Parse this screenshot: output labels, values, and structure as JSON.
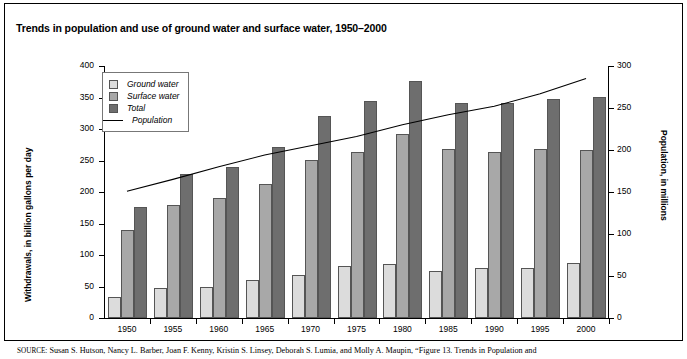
{
  "figure": {
    "title": "Trends in population and use of ground water and surface water, 1950–2000",
    "source_prefix": "SOURCE:",
    "source_text": "Susan S. Hutson, Nancy L. Barber, Joan F. Kenny, Kristin S. Linsey, Deborah S. Lumia, and Molly A. Maupin, “Figure 13. Trends in Population and"
  },
  "legend": {
    "position": "top-left-inside",
    "items": [
      {
        "label": "Ground water",
        "marker": "swatch",
        "color": "#dcdcdc",
        "icon": "legend-swatch-ground-water"
      },
      {
        "label": "Surface water",
        "marker": "swatch",
        "color": "#a8a8a8",
        "icon": "legend-swatch-surface-water"
      },
      {
        "label": "Total",
        "marker": "swatch",
        "color": "#6e6e6e",
        "icon": "legend-swatch-total"
      },
      {
        "label": "Population",
        "marker": "line",
        "color": "#000000",
        "icon": "legend-line-population"
      }
    ]
  },
  "chart_data": {
    "type": "bar",
    "title": "Trends in population and use of ground water and surface water, 1950–2000",
    "xlabel": "",
    "ylabel": "Withdrawals, in billion gallons per day",
    "y2label": "Population, in millions",
    "ylim": [
      0,
      400
    ],
    "y2lim": [
      0,
      300
    ],
    "yticks": [
      0,
      50,
      100,
      150,
      200,
      250,
      300,
      350,
      400
    ],
    "y2ticks": [
      0,
      50,
      100,
      150,
      200,
      250,
      300
    ],
    "grid": false,
    "categories": [
      "1950",
      "1955",
      "1960",
      "1965",
      "1970",
      "1975",
      "1980",
      "1985",
      "1990",
      "1995",
      "2000"
    ],
    "series": [
      {
        "name": "Ground water",
        "type": "bar",
        "axis": "left",
        "color": "#dcdcdc",
        "values": [
          34,
          47,
          50,
          60,
          68,
          83,
          86,
          74,
          80,
          79,
          87
        ]
      },
      {
        "name": "Surface water",
        "type": "bar",
        "axis": "left",
        "color": "#a8a8a8",
        "values": [
          140,
          180,
          190,
          213,
          251,
          263,
          292,
          269,
          263,
          268,
          267
        ]
      },
      {
        "name": "Total",
        "type": "bar",
        "axis": "left",
        "color": "#6e6e6e",
        "values": [
          176,
          228,
          240,
          271,
          320,
          345,
          377,
          341,
          342,
          347,
          351
        ]
      },
      {
        "name": "Population",
        "type": "line",
        "axis": "right",
        "color": "#000000",
        "values": [
          151,
          165,
          180,
          194,
          205,
          216,
          230,
          242,
          252,
          267,
          285
        ]
      }
    ]
  }
}
